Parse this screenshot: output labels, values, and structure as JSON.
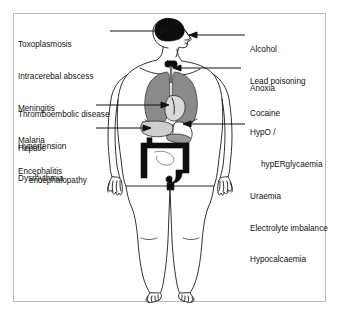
{
  "diagram": {
    "figure_name": "human-body-anatomical-figure",
    "colors": {
      "frame_border": "#b9b9b9",
      "background": "#ffffff",
      "outline": "#1a1a1a",
      "brain_fill": "#0d0d0d",
      "lung_fill": "#8a8a8a",
      "heart_fill": "#d8d8d8",
      "liver_fill": "#c9c9c9",
      "colon_fill": "#0d0d0d",
      "trachea_fill": "#0d0d0d",
      "text": "#111111"
    },
    "labels": {
      "brain_group": {
        "name": "brain-causes",
        "lines": [
          "Toxoplasmosis",
          "Intracerebal abscess",
          "Meningitis",
          "Malaria",
          "Encephalitis"
        ],
        "points_to": "brain"
      },
      "cardiac_group": {
        "name": "cardiac-causes",
        "lines": [
          "Thromboembolic disease",
          "Hypertension",
          "Dysrhythmia"
        ],
        "points_to": "heart"
      },
      "hepatic_group": {
        "name": "hepatic-causes",
        "line1": "Hepatic",
        "line2": "encephalopathy",
        "points_to": "liver"
      },
      "toxic_group": {
        "name": "toxic-ingestion-causes",
        "lines": [
          "Alcohol",
          "Lead poisoning",
          "Cocaine"
        ],
        "points_to": "mouth"
      },
      "anoxia_group": {
        "name": "respiratory-causes",
        "lines": [
          "Anoxia"
        ],
        "points_to": "trachea"
      },
      "metabolic_group": {
        "name": "metabolic-causes",
        "line1": "HypO /",
        "line2": "hypERglycaemia",
        "lines_rest": [
          "Uraemia",
          "Electrolyte imbalance",
          "Hypocalcaemia"
        ],
        "points_to": "pancreas"
      }
    },
    "organs": [
      {
        "name": "brain",
        "shade": "black"
      },
      {
        "name": "trachea-thyroid",
        "shade": "black"
      },
      {
        "name": "lungs",
        "shade": "gray"
      },
      {
        "name": "heart",
        "shade": "light-gray"
      },
      {
        "name": "liver",
        "shade": "light-gray"
      },
      {
        "name": "stomach",
        "shade": "white"
      },
      {
        "name": "pancreas",
        "shade": "gray"
      },
      {
        "name": "colon-large-intestine",
        "shade": "black"
      }
    ]
  }
}
